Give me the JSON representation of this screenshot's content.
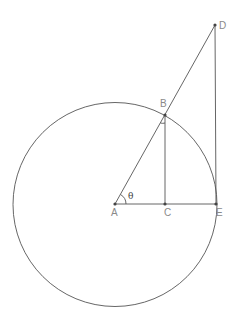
{
  "diagram": {
    "points": [
      {
        "id": "A",
        "label": "A"
      },
      {
        "id": "B",
        "label": "B"
      },
      {
        "id": "C",
        "label": "C"
      },
      {
        "id": "D",
        "label": "D"
      },
      {
        "id": "E",
        "label": "E"
      }
    ],
    "segments": [
      "AD",
      "BC",
      "AE",
      "DE"
    ],
    "angle_label": "θ",
    "angle_vertex": "A",
    "marked_angle_vertex": "B",
    "colors": {
      "line": "#555555",
      "label": "#8a8a8a",
      "point": "#444444"
    }
  }
}
